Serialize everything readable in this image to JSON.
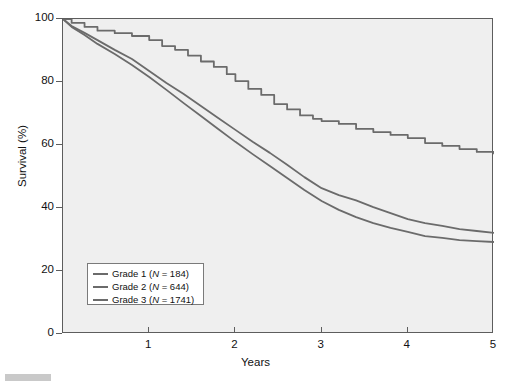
{
  "figure": {
    "background": "#ffffff",
    "plot_background": "#efefef",
    "axis_color": "#5d5d5d",
    "line_color": "#6b6b6b"
  },
  "axes": {
    "y_title": "Survival (%)",
    "x_title": "Years",
    "y_ticks": [
      "0",
      "20",
      "40",
      "60",
      "80",
      "100"
    ],
    "x_ticks": [
      "1",
      "2",
      "3",
      "4",
      "5"
    ]
  },
  "legend": {
    "entries": [
      {
        "label_prefix": "Grade 1 (",
        "n_symbol": "N",
        "label_suffix": " = 184)",
        "color": "#6b6b6b"
      },
      {
        "label_prefix": "Grade 2 (",
        "n_symbol": "N",
        "label_suffix": " = 644)",
        "color": "#6b6b6b"
      },
      {
        "label_prefix": "Grade 3 (",
        "n_symbol": "N",
        "label_suffix": " = 1741)",
        "color": "#6b6b6b"
      }
    ]
  },
  "chart_data": {
    "type": "line",
    "title": "",
    "subtitle": "",
    "xlabel": "Years",
    "ylabel": "Survival (%)",
    "xlim": [
      0,
      5
    ],
    "ylim": [
      0,
      100
    ],
    "xticks": [
      1,
      2,
      3,
      4,
      5
    ],
    "yticks": [
      0,
      20,
      40,
      60,
      80,
      100
    ],
    "grid": false,
    "legend_position": "lower-left",
    "plot_style": "kaplan-meier step curves",
    "series": [
      {
        "name": "Grade 1 (N = 184)",
        "color": "#6b6b6b",
        "x": [
          0,
          0.1,
          0.25,
          0.4,
          0.6,
          0.8,
          1.0,
          1.15,
          1.3,
          1.45,
          1.6,
          1.75,
          1.9,
          2.0,
          2.15,
          2.3,
          2.45,
          2.6,
          2.75,
          2.9,
          3.0,
          3.2,
          3.4,
          3.6,
          3.8,
          4.0,
          4.2,
          4.4,
          4.6,
          4.8,
          5.0
        ],
        "y": [
          100,
          98.8,
          97.5,
          96.3,
          95.5,
          94.6,
          93.3,
          91.4,
          90.2,
          88.4,
          86.5,
          84.8,
          82.5,
          80.3,
          77.8,
          75.9,
          73.0,
          71.3,
          69.4,
          68.3,
          67.6,
          66.7,
          65.1,
          64.1,
          63.2,
          62.2,
          60.6,
          59.7,
          58.7,
          57.8,
          57.1
        ]
      },
      {
        "name": "Grade 2 (N = 644)",
        "color": "#6b6b6b",
        "x": [
          0,
          0.1,
          0.25,
          0.4,
          0.6,
          0.8,
          1.0,
          1.2,
          1.4,
          1.6,
          1.8,
          2.0,
          2.2,
          2.4,
          2.6,
          2.8,
          3.0,
          3.2,
          3.4,
          3.6,
          3.8,
          4.0,
          4.2,
          4.4,
          4.6,
          4.8,
          5.0
        ],
        "y": [
          100,
          97.8,
          95.6,
          93.3,
          90.2,
          87.3,
          83.5,
          79.7,
          76.2,
          72.4,
          68.6,
          64.8,
          61.0,
          57.5,
          53.7,
          49.8,
          46.3,
          44.1,
          42.4,
          40.3,
          38.4,
          36.5,
          35.2,
          34.3,
          33.3,
          32.7,
          32.1
        ]
      },
      {
        "name": "Grade 3 (N = 1741)",
        "color": "#6b6b6b",
        "x": [
          0,
          0.1,
          0.25,
          0.4,
          0.6,
          0.8,
          1.0,
          1.2,
          1.4,
          1.6,
          1.8,
          2.0,
          2.2,
          2.4,
          2.6,
          2.8,
          3.0,
          3.2,
          3.4,
          3.6,
          3.8,
          4.0,
          4.2,
          4.4,
          4.6,
          4.8,
          5.0
        ],
        "y": [
          100,
          97.5,
          94.9,
          92.1,
          88.9,
          85.4,
          81.6,
          77.5,
          73.3,
          69.2,
          65.1,
          61.0,
          57.1,
          53.3,
          49.5,
          45.7,
          42.2,
          39.4,
          37.1,
          35.2,
          33.7,
          32.4,
          31.1,
          30.5,
          29.8,
          29.5,
          29.2
        ]
      }
    ]
  }
}
